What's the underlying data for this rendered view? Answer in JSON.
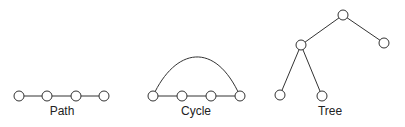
{
  "graphs": [
    {
      "label": "Path",
      "label_pos": [
        62,
        115
      ],
      "nodes": [
        [
          19,
          96
        ],
        [
          47,
          96
        ],
        [
          76,
          96
        ],
        [
          104,
          96
        ]
      ],
      "edges": [
        [
          0,
          1
        ],
        [
          1,
          2
        ],
        [
          2,
          3
        ]
      ]
    },
    {
      "label": "Cycle",
      "label_pos": [
        196,
        115
      ],
      "nodes": [
        [
          153,
          96
        ],
        [
          182,
          96
        ],
        [
          211,
          96
        ],
        [
          240,
          96
        ]
      ],
      "edges": [
        [
          0,
          1
        ],
        [
          1,
          2
        ],
        [
          2,
          3
        ]
      ],
      "arc": "M153 96 C 175 48, 215 40, 240 96"
    },
    {
      "label": "Tree",
      "label_pos": [
        330,
        115
      ],
      "nodes": [
        [
          343,
          15
        ],
        [
          301,
          45
        ],
        [
          384,
          43
        ],
        [
          280,
          95
        ],
        [
          322,
          96
        ]
      ],
      "edges": [
        [
          0,
          1
        ],
        [
          0,
          2
        ],
        [
          1,
          3
        ],
        [
          1,
          4
        ]
      ]
    }
  ],
  "style": {
    "node_radius": 5,
    "stroke": "#333333"
  }
}
